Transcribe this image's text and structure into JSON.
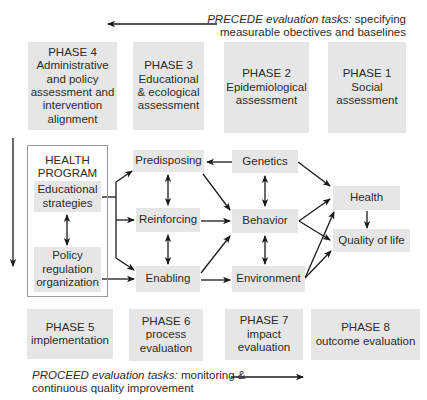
{
  "precede_note": {
    "italic": "PRECEDE evaluation tasks:",
    "rest": " specifying",
    "line2": "measurable obectives and baselines"
  },
  "proceed_note": {
    "italic": "PROCEED evaluation tasks:",
    "rest": " monitoring &",
    "line2": "continuous quality improvement"
  },
  "top_phases": [
    {
      "id": "phase4",
      "lines": [
        "PHASE 4",
        "Administrative",
        "and policy",
        "assessment and",
        "intervention",
        "alignment"
      ]
    },
    {
      "id": "phase3",
      "lines": [
        "PHASE 3",
        "Educational",
        "& ecological",
        "assessment"
      ]
    },
    {
      "id": "phase2",
      "lines": [
        "PHASE 2",
        "Epidemiological",
        "assessment"
      ]
    },
    {
      "id": "phase1",
      "lines": [
        "PHASE 1",
        "Social",
        "assessment"
      ]
    }
  ],
  "bottom_phases": [
    {
      "id": "phase5",
      "lines": [
        "PHASE 5",
        "implementation"
      ]
    },
    {
      "id": "phase6",
      "lines": [
        "PHASE 6",
        "process",
        "evaluation"
      ]
    },
    {
      "id": "phase7",
      "lines": [
        "PHASE 7",
        "impact",
        "evaluation"
      ]
    },
    {
      "id": "phase8",
      "lines": [
        "PHASE 8",
        "outcome evaluation"
      ]
    }
  ],
  "health_program": {
    "title_lines": [
      "HEALTH",
      "PROGRAM"
    ],
    "educational": [
      "Educational",
      "strategies"
    ],
    "policy": [
      "Policy",
      "regulation",
      "organization"
    ]
  },
  "factors": {
    "predisposing": "Predisposing",
    "reinforcing": "Reinforcing",
    "enabling": "Enabling",
    "genetics": "Genetics",
    "behavior": "Behavior",
    "environment": "Environment",
    "health": "Health",
    "quality_of_life": "Quality of life"
  },
  "colors": {
    "box_fill": "#e6e6e6",
    "arrow": "#1a1a1a",
    "frame_border": "#9a9a9a"
  }
}
